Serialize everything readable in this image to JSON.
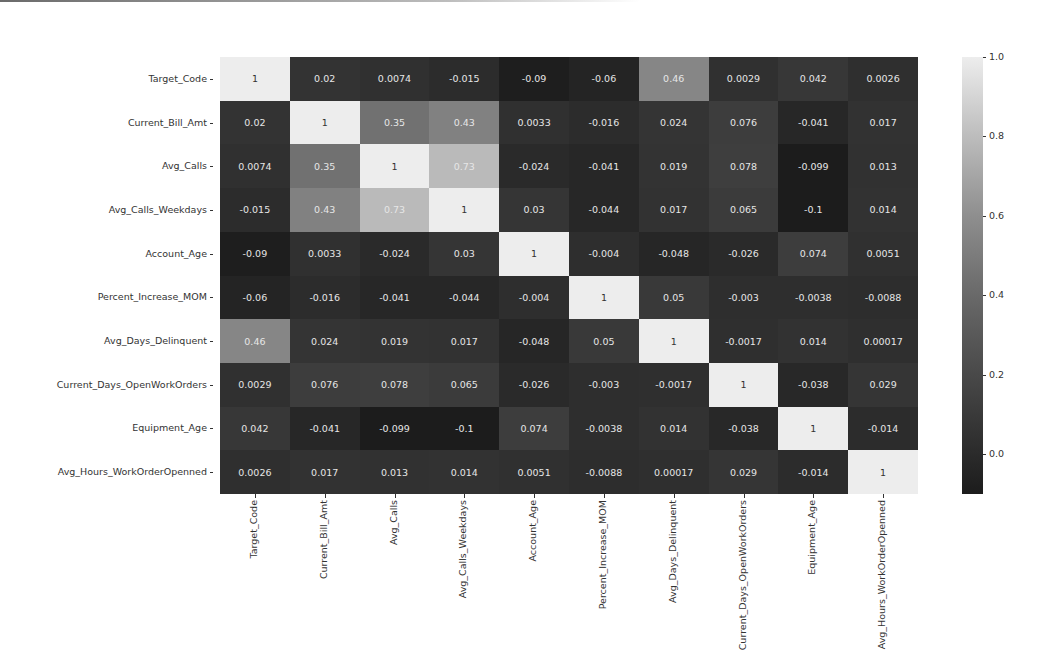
{
  "chart_data": {
    "type": "heatmap",
    "title": "",
    "xlabel": "",
    "ylabel": "",
    "labels": [
      "Target_Code",
      "Current_Bill_Amt",
      "Avg_Calls",
      "Avg_Calls_Weekdays",
      "Account_Age",
      "Percent_Increase_MOM",
      "Avg_Days_Delinquent",
      "Current_Days_OpenWorkOrders",
      "Equipment_Age",
      "Avg_Hours_WorkOrderOpenned"
    ],
    "matrix": [
      [
        "1",
        "0.02",
        "0.0074",
        "-0.015",
        "-0.09",
        "-0.06",
        "0.46",
        "0.0029",
        "0.042",
        "0.0026"
      ],
      [
        "0.02",
        "1",
        "0.35",
        "0.43",
        "0.0033",
        "-0.016",
        "0.024",
        "0.076",
        "-0.041",
        "0.017"
      ],
      [
        "0.0074",
        "0.35",
        "1",
        "0.73",
        "-0.024",
        "-0.041",
        "0.019",
        "0.078",
        "-0.099",
        "0.013"
      ],
      [
        "-0.015",
        "0.43",
        "0.73",
        "1",
        "0.03",
        "-0.044",
        "0.017",
        "0.065",
        "-0.1",
        "0.014"
      ],
      [
        "-0.09",
        "0.0033",
        "-0.024",
        "0.03",
        "1",
        "-0.004",
        "-0.048",
        "-0.026",
        "0.074",
        "0.0051"
      ],
      [
        "-0.06",
        "-0.016",
        "-0.041",
        "-0.044",
        "-0.004",
        "1",
        "0.05",
        "-0.003",
        "-0.0038",
        "-0.0088"
      ],
      [
        "0.46",
        "0.024",
        "0.019",
        "0.017",
        "-0.048",
        "0.05",
        "1",
        "-0.0017",
        "0.014",
        "0.00017"
      ],
      [
        "0.0029",
        "0.076",
        "0.078",
        "0.065",
        "-0.026",
        "-0.003",
        "-0.0017",
        "1",
        "-0.038",
        "0.029"
      ],
      [
        "0.042",
        "-0.041",
        "-0.099",
        "-0.1",
        "0.074",
        "-0.0038",
        "0.014",
        "-0.038",
        "1",
        "-0.014"
      ],
      [
        "0.0026",
        "0.017",
        "0.013",
        "0.014",
        "0.0051",
        "-0.0088",
        "0.00017",
        "0.029",
        "-0.014",
        "1"
      ]
    ],
    "colorbar": {
      "ticks": [
        "1.0",
        "0.8",
        "0.6",
        "0.4",
        "0.2",
        "0.0"
      ],
      "range": [
        -0.1,
        1.0
      ],
      "colormap": "grayscale (dark = low, light = high)"
    },
    "annotations": true,
    "grid": false,
    "legend_position": "right (colorbar)"
  }
}
